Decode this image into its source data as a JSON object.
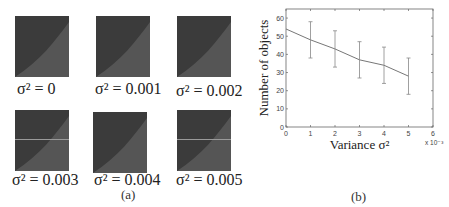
{
  "panel_a": {
    "label": "(a)",
    "tiles": [
      {
        "caption": "σ² = 0",
        "line": false
      },
      {
        "caption": "σ² = 0.001",
        "line": false
      },
      {
        "caption": "σ² = 0.002",
        "line": false
      },
      {
        "caption": "σ² = 0.003",
        "line": true
      },
      {
        "caption": "σ² = 0.004",
        "line": false
      },
      {
        "caption": "σ² = 0.005",
        "line": true
      }
    ]
  },
  "panel_b": {
    "label": "(b)"
  },
  "chart_data": {
    "type": "line",
    "title": "",
    "xlabel": "Variance σ²",
    "ylabel": "Number of objects",
    "x_multiplier": "x 10⁻³",
    "x": [
      0,
      1,
      2,
      3,
      4,
      5
    ],
    "xticks": [
      0,
      1,
      2,
      3,
      4,
      5,
      6
    ],
    "yticks": [
      0,
      10,
      20,
      30,
      40,
      50,
      60
    ],
    "xlim": [
      0,
      6
    ],
    "ylim": [
      0,
      65
    ],
    "series": [
      {
        "name": "Number of objects",
        "values": [
          54,
          48,
          43,
          37,
          34,
          28
        ],
        "error_low": [
          null,
          38,
          33,
          27,
          24,
          18
        ],
        "error_high": [
          null,
          58,
          53,
          47,
          44,
          38
        ]
      }
    ],
    "grid": false,
    "legend": "none"
  }
}
